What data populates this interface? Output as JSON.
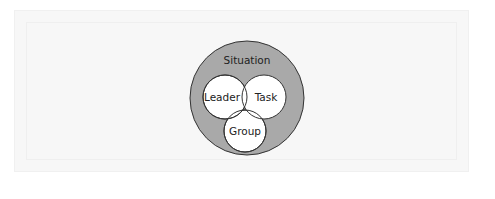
{
  "diagram": {
    "type": "nested-venn",
    "outer": {
      "label": "Situation",
      "fill": "#a9a9a9"
    },
    "circles": [
      {
        "label": "Leader"
      },
      {
        "label": "Task"
      },
      {
        "label": "Group"
      }
    ]
  }
}
